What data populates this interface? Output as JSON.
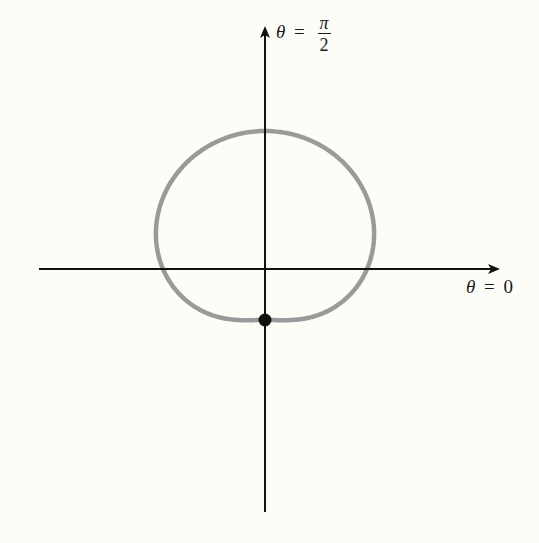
{
  "figure": {
    "type": "polar-curve-sketch",
    "axes": {
      "x_axis_label": {
        "lhs": "θ",
        "eq": "=",
        "rhs": "0"
      },
      "y_axis_label": {
        "lhs": "θ",
        "eq": "=",
        "num": "π",
        "den": "2"
      }
    },
    "curve": {
      "description": "dimpled limaçon-shaped closed curve about the origin",
      "color": "#9a9a9a",
      "stroke_width": 4.5,
      "radial_model_px": {
        "c0": 98.25,
        "c_sin": 43.5,
        "c_cos2": 3.75
      }
    },
    "marked_point": {
      "description": "point on negative vertical axis where curve has its dimple",
      "color": "#111111"
    },
    "colors": {
      "axis": "#111111",
      "background": "#fdfdf8"
    }
  }
}
